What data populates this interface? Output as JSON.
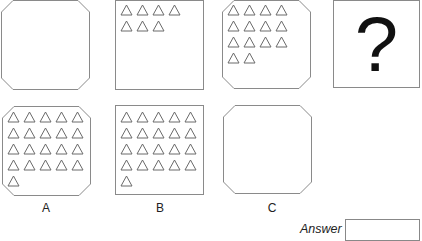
{
  "question": {
    "sequence": [
      {
        "id": "q1",
        "shape": "octagon",
        "triangle_count": 0
      },
      {
        "id": "q2",
        "shape": "square",
        "triangle_count": 7
      },
      {
        "id": "q3",
        "shape": "octagon",
        "triangle_count": 14
      },
      {
        "id": "q4",
        "shape": "square",
        "content": "?"
      }
    ]
  },
  "options": [
    {
      "label": "A",
      "shape": "octagon",
      "triangle_count": 21
    },
    {
      "label": "B",
      "shape": "square",
      "triangle_count": 21
    },
    {
      "label": "C",
      "shape": "octagon",
      "triangle_count": 0
    }
  ],
  "answer": {
    "label": "Answer",
    "value": ""
  },
  "colors": {
    "border": "#8a8a8a",
    "triangle": "#6a6a6a",
    "text": "#222222"
  }
}
